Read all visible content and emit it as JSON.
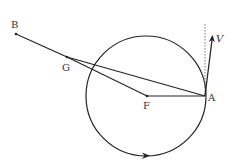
{
  "diagram": {
    "stroke_color": "#222222",
    "labels": {
      "B": "B",
      "G": "G",
      "F": "F",
      "A": "A",
      "V": "V"
    },
    "points": {
      "B": [
        16,
        34
      ],
      "G": [
        67,
        57
      ],
      "F": [
        147,
        96
      ],
      "A": [
        205,
        96
      ]
    },
    "circle": {
      "cx": 146,
      "cy": 96,
      "r": 60,
      "direction": "counterclockwise-arrow-at-bottom-pointing-right"
    },
    "velocity_vector": {
      "from": [
        205,
        96
      ],
      "to": [
        213,
        33
      ],
      "label": "V"
    },
    "dotted_vertical": {
      "x": 205,
      "y1": 24,
      "y2": 96
    }
  }
}
